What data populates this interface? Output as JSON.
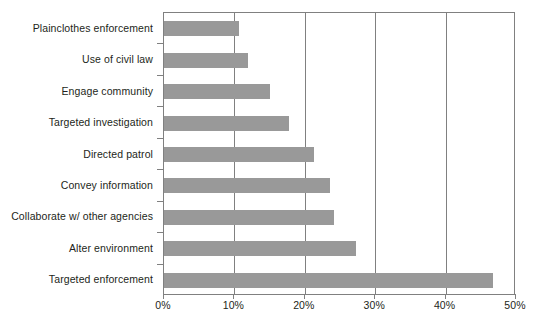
{
  "chart_data": {
    "type": "bar",
    "orientation": "horizontal",
    "title": "",
    "subtitle": "",
    "xlabel": "",
    "ylabel": "",
    "xlim": [
      0,
      50
    ],
    "ylim": null,
    "grid": true,
    "legend": null,
    "legend_position": "none",
    "bar_color": "#999999",
    "axis_color": "#808080",
    "text_color": "#231f20",
    "background_color": "#ffffff",
    "xtick_labels": [
      "0%",
      "10%",
      "20%",
      "30%",
      "40%",
      "50%"
    ],
    "xtick_values": [
      0,
      10,
      20,
      30,
      40,
      50
    ],
    "categories": [
      "Plainclothes enforcement",
      "Use of civil law",
      "Engage community",
      "Targeted investigation",
      "Directed patrol",
      "Convey information",
      "Collaborate w/ other agencies",
      "Alter environment",
      "Targeted enforcement"
    ],
    "values": [
      10.7,
      12.0,
      15.1,
      17.8,
      21.3,
      23.6,
      24.2,
      27.3,
      46.7
    ],
    "value_labels": [
      "10.7%",
      "12.0%",
      "15.1%",
      "17.8%",
      "21.3%",
      "23.6%",
      "24.2%",
      "27.3%",
      "46.7%"
    ],
    "series": [
      {
        "name": "",
        "values": [
          10.7,
          12.0,
          15.1,
          17.8,
          21.3,
          23.6,
          24.2,
          27.3,
          46.7
        ]
      }
    ]
  }
}
